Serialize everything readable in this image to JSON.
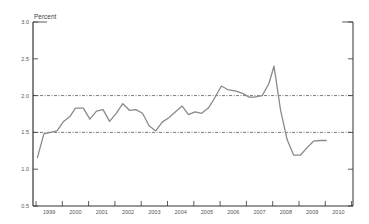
{
  "chart_data": {
    "type": "line",
    "title": "",
    "ylabel": "Percent",
    "xlabel": "",
    "ylim": [
      0.5,
      3.0
    ],
    "xlim": [
      1999,
      2010.75
    ],
    "yticks": [
      "0.5",
      "1.0",
      "1.5",
      "2.0",
      "2.5",
      "3.0"
    ],
    "xticks": [
      "1999",
      "2000",
      "2001",
      "2002",
      "2003",
      "2004",
      "2005",
      "2006",
      "2007",
      "2008",
      "2009",
      "2010"
    ],
    "grid": false,
    "legend": null,
    "reference_lines": [
      {
        "y": 2.0,
        "style": "dash-dot"
      },
      {
        "y": 1.5,
        "style": "dash-dot"
      }
    ],
    "series": [
      {
        "name": "Percent",
        "x": [
          1999.05,
          1999.3,
          1999.55,
          1999.8,
          2000.05,
          2000.3,
          2000.5,
          2000.8,
          2001.05,
          2001.3,
          2001.55,
          2001.8,
          2002.05,
          2002.3,
          2002.55,
          2002.8,
          2003.05,
          2003.3,
          2003.55,
          2003.8,
          2004.05,
          2004.55,
          2004.8,
          2005.05,
          2005.3,
          2005.55,
          2005.75,
          2006.05,
          2006.3,
          2006.6,
          2006.85,
          2007.1,
          2007.3,
          2007.6,
          2007.85,
          2008.05,
          2008.3,
          2008.55,
          2008.8,
          2009.05,
          2009.3,
          2009.55,
          2009.8,
          2010.05
        ],
        "values": [
          1.15,
          1.48,
          1.5,
          1.52,
          1.65,
          1.72,
          1.83,
          1.83,
          1.68,
          1.79,
          1.81,
          1.65,
          1.76,
          1.89,
          1.8,
          1.81,
          1.76,
          1.59,
          1.52,
          1.64,
          1.7,
          1.86,
          1.74,
          1.78,
          1.76,
          1.83,
          1.94,
          2.13,
          2.08,
          2.06,
          2.03,
          1.98,
          1.98,
          2.0,
          2.16,
          2.4,
          1.8,
          1.4,
          1.19,
          1.19,
          1.29,
          1.38,
          1.39,
          1.39
        ]
      }
    ]
  },
  "colors": {
    "axis": "#333333",
    "series": "#8a8a8a",
    "reference": "#555555"
  }
}
